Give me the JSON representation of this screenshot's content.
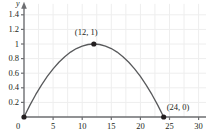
{
  "chart_data": {
    "type": "line",
    "title": "",
    "subtitle": "",
    "xlabel": "x",
    "ylabel": "y",
    "xlim": [
      0,
      31.5
    ],
    "ylim": [
      0,
      1.55
    ],
    "grid": true,
    "legend": null,
    "x_ticks": [
      {
        "value": 0,
        "label": "0"
      },
      {
        "value": 5,
        "label": "5"
      },
      {
        "value": 10,
        "label": "10"
      },
      {
        "value": 15,
        "label": "15"
      },
      {
        "value": 20,
        "label": "20"
      },
      {
        "value": 25,
        "label": "25"
      },
      {
        "value": 30,
        "label": "30"
      }
    ],
    "y_ticks": [
      {
        "value": 0.2,
        "label": "0.2"
      },
      {
        "value": 0.4,
        "label": "0.4"
      },
      {
        "value": 0.6,
        "label": "0.6"
      },
      {
        "value": 0.8,
        "label": "0.8"
      },
      {
        "value": 1.0,
        "label": "1"
      },
      {
        "value": 1.2,
        "label": "1.2"
      },
      {
        "value": 1.4,
        "label": "1.4"
      }
    ],
    "origin_label": "0",
    "series": [
      {
        "name": "parabola",
        "color": "#58595b",
        "equation_vertex": [
          12,
          1
        ],
        "roots": [
          0,
          24
        ],
        "x": [
          0,
          1,
          2,
          3,
          4,
          5,
          6,
          7,
          8,
          9,
          10,
          11,
          12,
          13,
          14,
          15,
          16,
          17,
          18,
          19,
          20,
          21,
          22,
          23,
          24
        ],
        "y": [
          0,
          0.1597,
          0.3056,
          0.4375,
          0.5556,
          0.6597,
          0.75,
          0.8264,
          0.8889,
          0.9375,
          0.9722,
          0.9931,
          1,
          0.9931,
          0.9722,
          0.9375,
          0.8889,
          0.8264,
          0.75,
          0.6597,
          0.5556,
          0.4375,
          0.3056,
          0.1597,
          0
        ]
      }
    ],
    "marked_points": [
      {
        "x": 0,
        "y": 0,
        "label": "",
        "show_label": false
      },
      {
        "x": 12,
        "y": 1,
        "label": "(12, 1)",
        "show_label": true
      },
      {
        "x": 24,
        "y": 0,
        "label": "(24, 0)",
        "show_label": true
      }
    ],
    "colors": {
      "curve": "#58595b",
      "axis": "#6d6e71",
      "grid": "#eeeeee",
      "text": "#231f20",
      "point": "#231f20",
      "background": "#ffffff"
    }
  }
}
